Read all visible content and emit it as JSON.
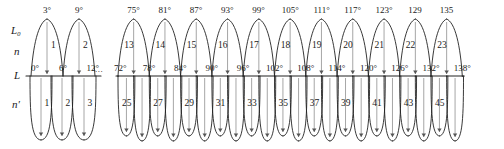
{
  "figure": {
    "type": "lobe-diagram",
    "axis_labels": {
      "upper_envelope": "L₀",
      "upper_order": "n",
      "baseline": "L",
      "lower_order": "n′"
    },
    "ellipsis": "...",
    "stroke_color": "#222222",
    "leader_color": "#8a8a8a"
  },
  "left_group": {
    "top_angles": [
      "3°",
      "9°"
    ],
    "baseline_angles": [
      "0°",
      "6°",
      "12°"
    ],
    "upper_numbers": [
      "1",
      "2"
    ],
    "lower_numbers": [
      "1",
      "2",
      "3"
    ]
  },
  "right_group": {
    "top_angles": [
      "75°",
      "81°",
      "87°",
      "93°",
      "99°",
      "105°",
      "111°",
      "117°",
      "123°",
      "129",
      "135"
    ],
    "baseline_angles": [
      "72°",
      "78°",
      "84°",
      "90°",
      "96°",
      "102°",
      "108°",
      "114°",
      "120°",
      "126°",
      "132°",
      "138°"
    ],
    "upper_numbers": [
      "13",
      "14",
      "15",
      "16",
      "17",
      "18",
      "19",
      "20",
      "21",
      "22",
      "23"
    ],
    "lower_numbers": [
      "25",
      "27",
      "29",
      "31",
      "33",
      "35",
      "37",
      "39",
      "41",
      "43",
      "45"
    ]
  }
}
